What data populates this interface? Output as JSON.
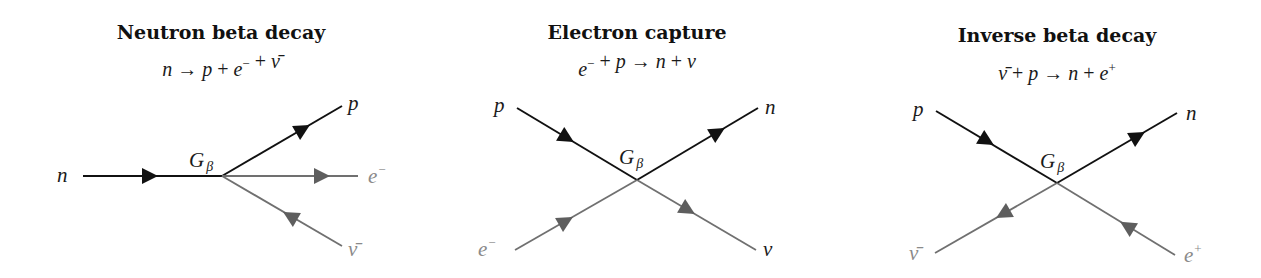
{
  "colors": {
    "black_line": "#111111",
    "gray_line": "#707070",
    "gray_arrow": "#5e5e5e",
    "gray_label": "#8a8a8a",
    "black_label": "#1a1a1a"
  },
  "diagrams": [
    {
      "id": "neutron-beta-decay",
      "title": "Neutron beta decay",
      "title_pos": [
        221,
        39
      ],
      "equation": [
        {
          "t": "n",
          "i": true
        },
        {
          "t": " → ",
          "i": false
        },
        {
          "t": "p",
          "i": true
        },
        {
          "t": " + ",
          "i": false
        },
        {
          "t": "e",
          "i": true,
          "sup": "−"
        },
        {
          "t": " + ",
          "i": false
        },
        {
          "t": "ν̄",
          "i": true
        }
      ],
      "equation_text": "n → p + e⁻ + ν̄",
      "equation_pos": [
        221,
        76
      ],
      "vertex": [
        222,
        176
      ],
      "coupling_label": {
        "main": "G",
        "sub": "β",
        "pos": [
          189,
          167
        ]
      },
      "lines": [
        {
          "name": "neutron-line",
          "from": [
            83,
            176
          ],
          "to": [
            222,
            176
          ],
          "color": "black",
          "arrow_at": [
            150,
            176
          ],
          "arrow_dir": "forward"
        },
        {
          "name": "proton-line",
          "from": [
            222,
            176
          ],
          "to": [
            342,
            106
          ],
          "color": "black",
          "arrow_at": [
            303,
            129
          ],
          "arrow_dir": "forward"
        },
        {
          "name": "electron-line",
          "from": [
            222,
            176
          ],
          "to": [
            358,
            176
          ],
          "color": "gray",
          "arrow_at": [
            322,
            176
          ],
          "arrow_dir": "forward"
        },
        {
          "name": "antineutrino-line",
          "from": [
            222,
            176
          ],
          "to": [
            342,
            246
          ],
          "color": "gray",
          "arrow_at": [
            290,
            216
          ],
          "arrow_dir": "backward"
        }
      ],
      "labels": [
        {
          "name": "neutron-label",
          "text": "n",
          "sup": "",
          "pos": [
            57,
            182
          ],
          "color": "black"
        },
        {
          "name": "proton-label",
          "text": "p",
          "sup": "",
          "pos": [
            348,
            110
          ],
          "color": "black"
        },
        {
          "name": "electron-label",
          "text": "e",
          "sup": "−",
          "pos": [
            368,
            183
          ],
          "color": "gray"
        },
        {
          "name": "antineutrino-label",
          "text": "ν̄",
          "sup": "",
          "pos": [
            348,
            256
          ],
          "color": "gray"
        }
      ]
    },
    {
      "id": "electron-capture",
      "title": "Electron capture",
      "title_pos": [
        637,
        39
      ],
      "equation": [
        {
          "t": "e",
          "i": true,
          "sup": "−"
        },
        {
          "t": " + ",
          "i": false
        },
        {
          "t": "p",
          "i": true
        },
        {
          "t": " → ",
          "i": false
        },
        {
          "t": "n",
          "i": true
        },
        {
          "t": " + ",
          "i": false
        },
        {
          "t": "ν",
          "i": true
        }
      ],
      "equation_text": "e⁻ + p → n + ν",
      "equation_pos": [
        637,
        76
      ],
      "vertex": [
        637,
        180
      ],
      "coupling_label": {
        "main": "G",
        "sub": "β",
        "pos": [
          619,
          164
        ]
      },
      "lines": [
        {
          "name": "proton-line",
          "from": [
            517,
            108
          ],
          "to": [
            637,
            180
          ],
          "color": "black",
          "arrow_at": [
            567,
            138
          ],
          "arrow_dir": "forward"
        },
        {
          "name": "neutron-line",
          "from": [
            637,
            180
          ],
          "to": [
            758,
            108
          ],
          "color": "black",
          "arrow_at": [
            718,
            132
          ],
          "arrow_dir": "forward"
        },
        {
          "name": "electron-line",
          "from": [
            515,
            250
          ],
          "to": [
            637,
            180
          ],
          "color": "gray",
          "arrow_at": [
            566,
            221
          ],
          "arrow_dir": "forward"
        },
        {
          "name": "neutrino-line",
          "from": [
            637,
            180
          ],
          "to": [
            756,
            250
          ],
          "color": "gray",
          "arrow_at": [
            688,
            210
          ],
          "arrow_dir": "forward"
        }
      ],
      "labels": [
        {
          "name": "proton-label",
          "text": "p",
          "sup": "",
          "pos": [
            494,
            112
          ],
          "color": "black"
        },
        {
          "name": "neutron-label",
          "text": "n",
          "sup": "",
          "pos": [
            765,
            114
          ],
          "color": "black"
        },
        {
          "name": "electron-label",
          "text": "e",
          "sup": "−",
          "pos": [
            478,
            256
          ],
          "color": "gray"
        },
        {
          "name": "neutrino-label",
          "text": "ν",
          "sup": "",
          "pos": [
            763,
            256
          ],
          "color": "black"
        }
      ]
    },
    {
      "id": "inverse-beta-decay",
      "title": "Inverse beta decay",
      "title_pos": [
        1057,
        42
      ],
      "equation": [
        {
          "t": "ν̄",
          "i": true
        },
        {
          "t": " + ",
          "i": false
        },
        {
          "t": "p",
          "i": true
        },
        {
          "t": " → ",
          "i": false
        },
        {
          "t": "n",
          "i": true
        },
        {
          "t": " + ",
          "i": false
        },
        {
          "t": "e",
          "i": true,
          "sup": "+"
        }
      ],
      "equation_text": "ν̄ + p → n + e⁺",
      "equation_pos": [
        1057,
        80
      ],
      "vertex": [
        1057,
        183
      ],
      "coupling_label": {
        "main": "G",
        "sub": "β",
        "pos": [
          1040,
          168
        ]
      },
      "lines": [
        {
          "name": "proton-line",
          "from": [
            936,
            111
          ],
          "to": [
            1057,
            183
          ],
          "color": "black",
          "arrow_at": [
            987,
            141
          ],
          "arrow_dir": "forward"
        },
        {
          "name": "neutron-line",
          "from": [
            1057,
            183
          ],
          "to": [
            1177,
            113
          ],
          "color": "black",
          "arrow_at": [
            1138,
            136
          ],
          "arrow_dir": "forward"
        },
        {
          "name": "antineutrino-line",
          "from": [
            935,
            253
          ],
          "to": [
            1057,
            183
          ],
          "color": "gray",
          "arrow_at": [
            1003,
            214
          ],
          "arrow_dir": "backward"
        },
        {
          "name": "positron-line",
          "from": [
            1057,
            183
          ],
          "to": [
            1175,
            255
          ],
          "color": "gray",
          "arrow_at": [
            1127,
            226
          ],
          "arrow_dir": "backward"
        }
      ],
      "labels": [
        {
          "name": "proton-label",
          "text": "p",
          "sup": "",
          "pos": [
            913,
            116
          ],
          "color": "black"
        },
        {
          "name": "neutron-label",
          "text": "n",
          "sup": "",
          "pos": [
            1186,
            120
          ],
          "color": "black"
        },
        {
          "name": "antineutrino-label",
          "text": "ν̄",
          "sup": "",
          "pos": [
            909,
            260
          ],
          "color": "gray"
        },
        {
          "name": "positron-label",
          "text": "e",
          "sup": "+",
          "pos": [
            1184,
            262
          ],
          "color": "gray"
        }
      ]
    }
  ]
}
